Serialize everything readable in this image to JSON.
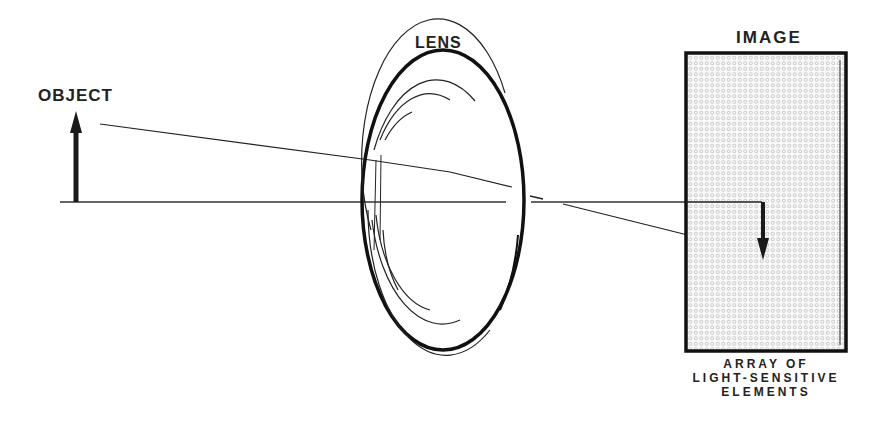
{
  "labels": {
    "object": "OBJECT",
    "lens": "LENS",
    "image": "IMAGE"
  },
  "caption": {
    "lines": [
      "ARRAY OF",
      "LIGHT-SENSITIVE",
      "ELEMENTS"
    ]
  },
  "colors": {
    "ink": "#1a1a1a",
    "sensor_fill": "#f4f4f4",
    "dot": "#b8b8b8"
  }
}
